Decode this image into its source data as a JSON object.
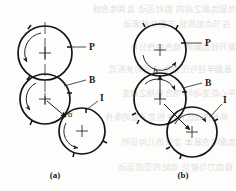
{
  "figure": {
    "panels": [
      {
        "id": "a",
        "caption": "(a)",
        "labels": {
          "pitch": "P",
          "base": "B",
          "idler": "I",
          "point": "a"
        },
        "circles": [
          {
            "name": "P",
            "cx": 45,
            "cy": 53,
            "r": 27
          },
          {
            "name": "B",
            "cx": 45,
            "cy": 99,
            "r": 25
          },
          {
            "name": "I",
            "cx": 82,
            "cy": 131,
            "r": 23
          }
        ]
      },
      {
        "id": "b",
        "caption": "(b)",
        "labels": {
          "pitch": "P",
          "base": "B",
          "idler": "I",
          "point": "b"
        },
        "circles": [
          {
            "name": "P",
            "cx": 160,
            "cy": 50,
            "r": 26
          },
          {
            "name": "B",
            "cx": 160,
            "cy": 99,
            "r": 26
          },
          {
            "name": "I",
            "cx": 192,
            "cy": 132,
            "r": 25
          }
        ]
      }
    ],
    "colors": {
      "line": "#141414",
      "thin_line": "#3a3a3a",
      "text": "#171717",
      "background": "#fdfdfc",
      "bleed_text": "#9b9a96"
    },
    "bleed_through_rows": [
      "共轭齿廓之间的 相对运动 及其啮合线",
      "在节点处两轮 节圆作纯滚动",
      "渐开线齿廓的 啮合特性分析",
      "基圆半径与压力角 之间的关系式",
      "中心距变动时 啮合角随之改变",
      "两轮传动比保持 恒定不变的条件",
      "齿廓啮合基本 定律的几何证明",
      "插齿刀与被切 齿轮的范成运动"
    ]
  }
}
